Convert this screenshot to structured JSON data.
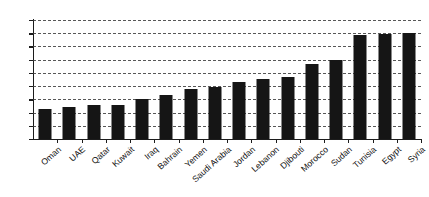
{
  "chart_data": {
    "type": "bar",
    "title": "",
    "subtitle": "",
    "xlabel": "",
    "ylabel": "",
    "ylim": [
      0,
      45
    ],
    "ytick_step": 5,
    "yticks": [
      0,
      5,
      10,
      15,
      20,
      25,
      30,
      35,
      40,
      45
    ],
    "grid": true,
    "grid_style": "dashed-horizontal",
    "legend": false,
    "legend_position": "none",
    "bar_color": "#151515",
    "axis_color": "#1c1c1c",
    "background": "#ffffff",
    "xlabel_rotation": -42,
    "categories": [
      "Oman",
      "UAE",
      "Qatar",
      "Kuwait",
      "Iraq",
      "Bahrain",
      "Yemen",
      "Saudi Arabia",
      "Jordan",
      "Lebanon",
      "Djibouti",
      "Morocco",
      "Sudan",
      "Tunisia",
      "Egypt",
      "Syria"
    ],
    "values": [
      11.5,
      12.2,
      13.0,
      13.0,
      15.0,
      16.5,
      19.0,
      19.5,
      21.7,
      22.6,
      23.6,
      28.5,
      29.7,
      39.5,
      39.7,
      40.2
    ]
  }
}
